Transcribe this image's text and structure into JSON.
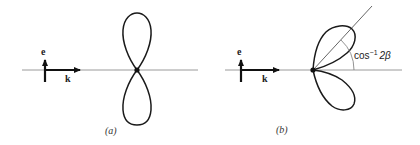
{
  "panels": [
    {
      "id": "a",
      "caption": "(a)",
      "vectors": {
        "polarization_label": "e",
        "wavevector_label": "k"
      },
      "description": "Dipole radiation pattern: symmetric figure-eight lobes along e"
    },
    {
      "id": "b",
      "caption": "(b)",
      "vectors": {
        "polarization_label": "e",
        "wavevector_label": "k"
      },
      "angle_label_base": "cos",
      "angle_label_exp": "−1",
      "angle_label_arg": "2β",
      "description": "Lobes tilted forward; peak direction at angle cos^-1 2beta from k"
    }
  ],
  "colors": {
    "curve": "#1a1a1a",
    "axis": "#9a9a9a",
    "text": "#222222",
    "background": "#ffffff"
  }
}
